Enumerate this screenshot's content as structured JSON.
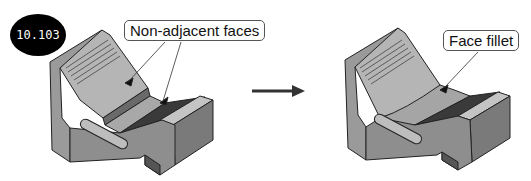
{
  "figure": {
    "number": "10.103",
    "before": {
      "callout": "Non-adjacent faces"
    },
    "after": {
      "callout": "Face fillet"
    },
    "arrow": "right-arrow"
  },
  "colors": {
    "face_top": "#b8b8b8",
    "face_front": "#8f8f8f",
    "face_side": "#6f6f6f",
    "outline": "#222222",
    "badge": "#000000"
  }
}
